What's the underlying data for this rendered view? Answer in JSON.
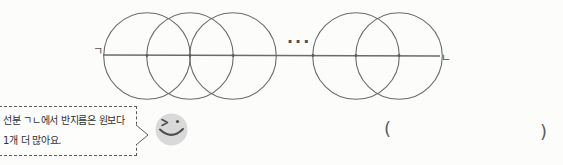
{
  "figure": {
    "stroke_color": "#6b6b6b",
    "line": {
      "x1": 103,
      "y1": 55,
      "x2": 440,
      "y2": 56
    },
    "radius": 43.3,
    "center_y": 56,
    "circle_centers_x": [
      147,
      190,
      233,
      356,
      399
    ],
    "dot_xs": [
      147,
      190,
      233,
      313,
      356,
      399
    ],
    "label_start": "ㄱ",
    "label_end": "ㄴ",
    "ellipsis": "..."
  },
  "speech_bubble": {
    "line1": "선분 ㄱㄴ에서 반지름은 원보다",
    "line2": "1개 더 많아요."
  },
  "answer": {
    "open_paren": "(",
    "close_paren": ")"
  }
}
